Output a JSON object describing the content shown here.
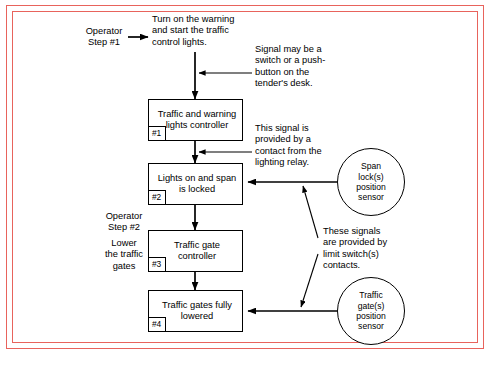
{
  "figure": {
    "type": "flowchart",
    "frame_color": "#e8635c",
    "line_color": "#000000"
  },
  "operator_steps": [
    {
      "id": "step-1",
      "label": "Operator\nStep #1"
    },
    {
      "id": "step-2",
      "label": "Operator\nStep #2"
    }
  ],
  "instructions": [
    {
      "id": "instruction-1",
      "label": "Turn on the warning\nand start the traffic\ncontrol lights."
    },
    {
      "id": "instruction-2",
      "label": "Lower\nthe traffic\ngates"
    }
  ],
  "process_boxes": [
    {
      "id": "box-1",
      "number": "#1",
      "label": "Traffic and\nwarning lights\ncontroller"
    },
    {
      "id": "box-2",
      "number": "#2",
      "label": "Lights on and\nspan is locked"
    },
    {
      "id": "box-3",
      "number": "#3",
      "label": "Traffic gate\ncontroller"
    },
    {
      "id": "box-4",
      "number": "#4",
      "label": "Traffic gates\nfully lowered"
    }
  ],
  "sensors": [
    {
      "id": "sensor-span-lock",
      "label": "Span\nlock(s)\nposition\nsensor"
    },
    {
      "id": "sensor-traffic-gate",
      "label": "Traffic\ngate(s)\nposition\nsensor"
    }
  ],
  "annotations": [
    {
      "id": "annotation-signal-source",
      "label": "Signal may be a\nswitch or a push-\nbutton on the\ntender's desk."
    },
    {
      "id": "annotation-lighting-relay",
      "label": "This signal is\nprovided by a\ncontact from the\nlighting relay."
    },
    {
      "id": "annotation-limit-switch",
      "label": "These signals\nare provided by\nlimit switch(s)\ncontacts."
    }
  ]
}
